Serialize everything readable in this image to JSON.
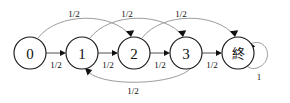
{
  "diagram": {
    "type": "state-transition-diagram",
    "title": "",
    "background_color": "#ffffff",
    "node_stroke_color": "#1a1a1a",
    "edge_color": "#3d3d3d",
    "arc_color": "#8a8a8a",
    "label_color": "#111111",
    "nodes": [
      {
        "id": "n0",
        "label": "0",
        "cx": 30,
        "cy": 53,
        "r": 16
      },
      {
        "id": "n1",
        "label": "1",
        "cx": 82,
        "cy": 53,
        "r": 16
      },
      {
        "id": "n2",
        "label": "2",
        "cx": 134,
        "cy": 53,
        "r": 16
      },
      {
        "id": "n3",
        "label": "3",
        "cx": 186,
        "cy": 53,
        "r": 16
      },
      {
        "id": "ne",
        "label": "終",
        "cx": 238,
        "cy": 53,
        "r": 16
      }
    ],
    "edges": [
      {
        "id": "e0",
        "from": "0",
        "to": "1",
        "label": "1/2",
        "kind": "straight",
        "label_x": 56,
        "label_y": 65
      },
      {
        "id": "e1",
        "from": "1",
        "to": "2",
        "label": "1/2",
        "kind": "straight",
        "label_x": 108,
        "label_y": 65
      },
      {
        "id": "e2",
        "from": "2",
        "to": "3",
        "label": "1/2",
        "kind": "straight",
        "label_x": 160,
        "label_y": 65
      },
      {
        "id": "e3",
        "from": "3",
        "to": "終",
        "label": "1/2",
        "kind": "straight",
        "label_x": 212,
        "label_y": 65
      },
      {
        "id": "e4",
        "from": "0",
        "to": "2",
        "label": "1/2",
        "kind": "arc-top",
        "label_x": 74,
        "label_y": 14
      },
      {
        "id": "e5",
        "from": "1",
        "to": "3",
        "label": "1/2",
        "kind": "arc-top",
        "label_x": 127,
        "label_y": 14
      },
      {
        "id": "e6",
        "from": "2",
        "to": "終",
        "label": "1/2",
        "kind": "arc-top",
        "label_x": 181,
        "label_y": 14
      },
      {
        "id": "e7",
        "from": "3",
        "to": "1",
        "label": "1/2",
        "kind": "arc-bottom",
        "label_x": 133,
        "label_y": 91
      },
      {
        "id": "e8",
        "from": "終",
        "to": "終",
        "label": "1",
        "kind": "self-loop",
        "label_x": 259,
        "label_y": 77
      }
    ]
  }
}
